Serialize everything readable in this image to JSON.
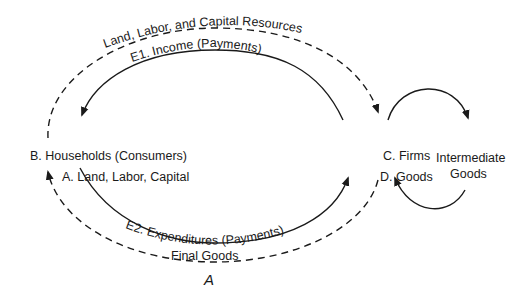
{
  "diagram": {
    "nodes": {
      "households": "B. Households (Consumers)",
      "land_labor_capital": "A. Land, Labor, Capital",
      "firms": "C. Firms",
      "goods": "D. Goods",
      "intermediate_goods_line1": "Intermediate",
      "intermediate_goods_line2": "Goods"
    },
    "flows": {
      "resources": "Land, Labor, and Capital Resources",
      "income": "E1. Income (Payments)",
      "expenditures": "E2. Expenditures (Payments)",
      "final_goods": "Final Goods"
    },
    "caption": "A"
  }
}
